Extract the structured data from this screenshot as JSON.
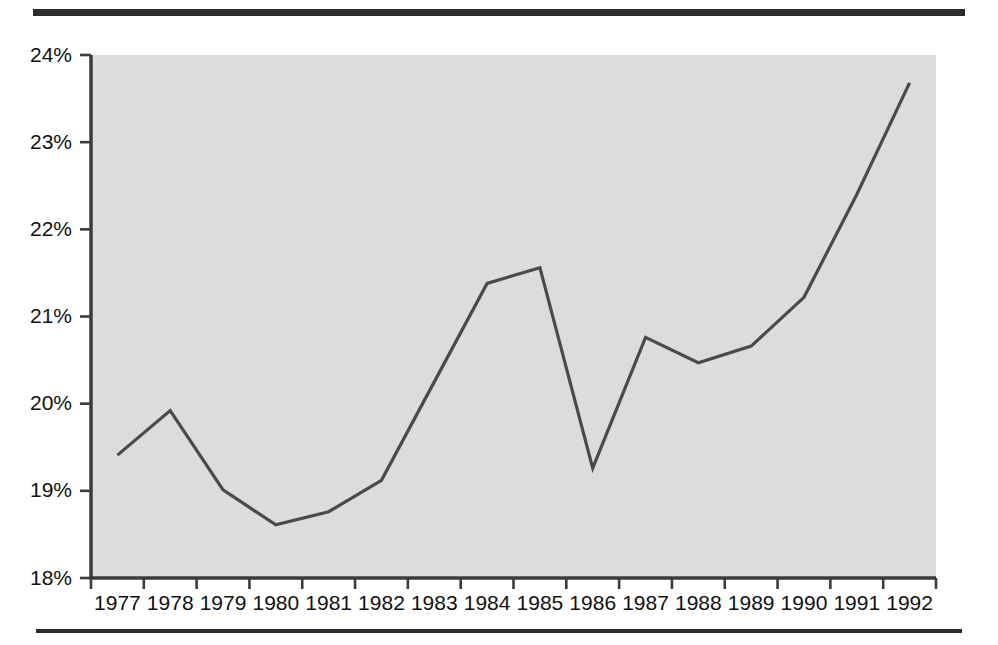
{
  "figure": {
    "top_rule": "horizontal-rule-thick",
    "bottom_rule": "horizontal-rule-thin"
  },
  "chart_data": {
    "type": "line",
    "title": "",
    "subtitle": "",
    "xlabel": "",
    "ylabel": "",
    "categories": [
      "1977",
      "1978",
      "1979",
      "1980",
      "1981",
      "1982",
      "1983",
      "1984",
      "1985",
      "1986",
      "1987",
      "1988",
      "1989",
      "1990",
      "1991",
      "1992"
    ],
    "values": [
      19.41,
      19.92,
      19.01,
      18.61,
      18.76,
      19.12,
      20.25,
      21.38,
      21.56,
      19.26,
      20.76,
      20.47,
      20.66,
      21.22,
      22.4,
      23.68
    ],
    "series": [
      {
        "name": "percent",
        "values": [
          19.41,
          19.92,
          19.01,
          18.61,
          18.76,
          19.12,
          20.25,
          21.38,
          21.56,
          19.26,
          20.76,
          20.47,
          20.66,
          21.22,
          22.4,
          23.68
        ]
      }
    ],
    "ylim": [
      18,
      24
    ],
    "ytick_values": [
      18,
      19,
      20,
      21,
      22,
      23,
      24
    ],
    "ytick_labels": [
      "18%",
      "19%",
      "20%",
      "21%",
      "22%",
      "23%",
      "24%"
    ],
    "xtick_labels": [
      "1977",
      "1978",
      "1979",
      "1980",
      "1981",
      "1982",
      "1983",
      "1984",
      "1985",
      "1986",
      "1987",
      "1988",
      "1989",
      "1990",
      "1991",
      "1992"
    ],
    "grid": false,
    "legend": false,
    "legend_position": "none",
    "annotations": [],
    "colors": {
      "line": "#4a4a4a",
      "plot_background": "#dcdcdc",
      "axis": "#3c3c3c",
      "text": "#111111",
      "rule": "#2b2b2b",
      "page_background": "#ffffff"
    }
  }
}
